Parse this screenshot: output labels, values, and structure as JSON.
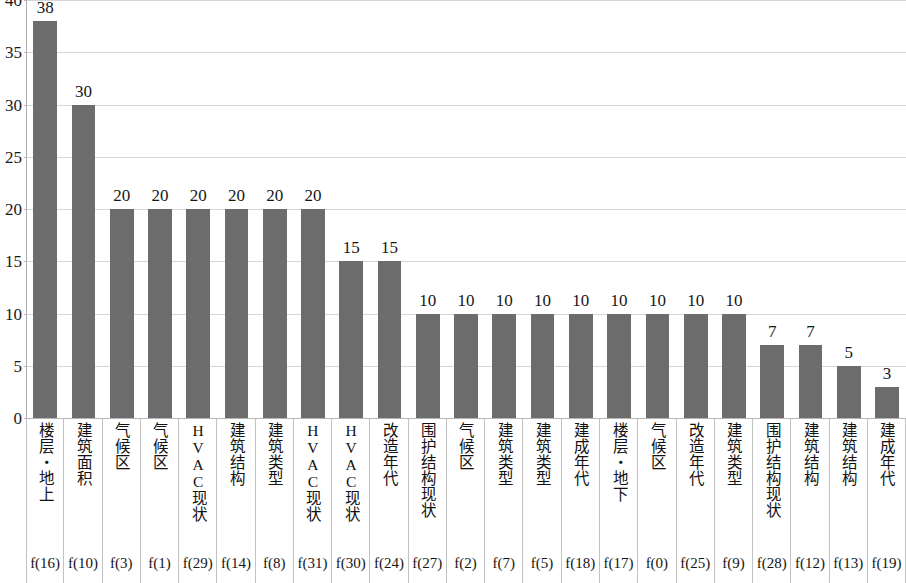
{
  "chart_data": {
    "type": "bar",
    "title": "",
    "subtitle": "",
    "xlabel": "",
    "ylabel": "",
    "ylim": [
      0,
      40
    ],
    "y_ticks": [
      0,
      5,
      10,
      15,
      20,
      25,
      30,
      35,
      40
    ],
    "grid": true,
    "legend": false,
    "bar_color": "#6c6c6c",
    "gridline_color": "#d7d7d7",
    "categories": [
      "楼层・地上",
      "建筑面积",
      "气候区",
      "气候区",
      "HVAC现状",
      "建筑结构",
      "建筑类型",
      "HVAC现状",
      "HVAC现状",
      "改造年代",
      "围护结构现状",
      "气候区",
      "建筑类型",
      "建筑类型",
      "建成年代",
      "楼层・地下",
      "气候区",
      "改造年代",
      "建筑类型",
      "围护结构现状",
      "建筑结构",
      "建筑结构",
      "建成年代"
    ],
    "codes": [
      "f(16)",
      "f(10)",
      "f(3)",
      "f(1)",
      "f(29)",
      "f(14)",
      "f(8)",
      "f(31)",
      "f(30)",
      "f(24)",
      "f(27)",
      "f(2)",
      "f(7)",
      "f(5)",
      "f(18)",
      "f(17)",
      "f(0)",
      "f(25)",
      "f(9)",
      "f(28)",
      "f(12)",
      "f(13)",
      "f(19)"
    ],
    "values": [
      38,
      30,
      20,
      20,
      20,
      20,
      20,
      20,
      15,
      15,
      10,
      10,
      10,
      10,
      10,
      10,
      10,
      10,
      10,
      7,
      7,
      5,
      3
    ],
    "value_labels": [
      "38",
      "30",
      "20",
      "20",
      "20",
      "20",
      "20",
      "20",
      "15",
      "15",
      "10",
      "10",
      "10",
      "10",
      "10",
      "10",
      "10",
      "10",
      "10",
      "7",
      "7",
      "5",
      "3"
    ],
    "y_tick_labels": [
      "0",
      "5",
      "10",
      "15",
      "20",
      "25",
      "30",
      "35",
      "40"
    ]
  }
}
